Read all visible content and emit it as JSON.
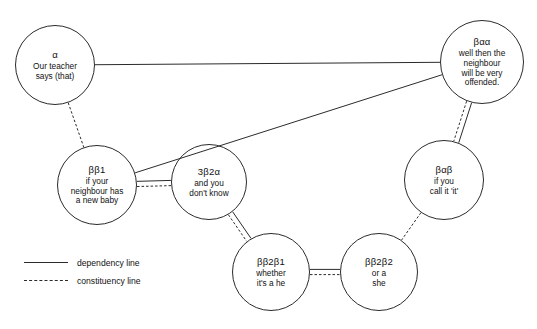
{
  "diagram": {
    "width": 537,
    "height": 329,
    "stroke_color": "#2b2b2b",
    "background_color": "#ffffff",
    "nodes": [
      {
        "id": "alpha",
        "label": "α",
        "lines": [
          "Our teacher",
          "says (that)"
        ],
        "cx": 55,
        "cy": 65,
        "r": 40
      },
      {
        "id": "beta-alpha-alpha",
        "label": "βαα",
        "lines": [
          "well then the",
          "neighbour",
          "will be very",
          "offended."
        ],
        "cx": 482,
        "cy": 62,
        "r": 42
      },
      {
        "id": "beta-beta-1",
        "label": "ββ1",
        "lines": [
          "if your",
          "neighbour has",
          "a new baby"
        ],
        "cx": 97,
        "cy": 185,
        "r": 40
      },
      {
        "id": "three-beta-2-alpha",
        "label": "3β2α",
        "lines": [
          "and you",
          "don't know"
        ],
        "cx": 209,
        "cy": 182,
        "r": 38
      },
      {
        "id": "beta-alpha-beta",
        "label": "βαβ",
        "lines": [
          "if you",
          "call it 'it'"
        ],
        "cx": 444,
        "cy": 180,
        "r": 40
      },
      {
        "id": "beta-beta-2-beta-1",
        "label": "ββ2β1",
        "lines": [
          "whether",
          "it's a he"
        ],
        "cx": 271,
        "cy": 272,
        "r": 39
      },
      {
        "id": "beta-beta-2-beta-2",
        "label": "ββ2β2",
        "lines": [
          "or a",
          "she"
        ],
        "cx": 379,
        "cy": 272,
        "r": 39
      }
    ],
    "edges": [
      {
        "id": "alpha-to-beta-alpha-alpha",
        "from": "alpha",
        "to": "beta-alpha-alpha",
        "kind": "dependency"
      },
      {
        "id": "beta-alpha-alpha-to-beta-beta-1",
        "from": "beta-alpha-alpha",
        "to": "beta-beta-1",
        "kind": "dependency"
      },
      {
        "id": "alpha-to-beta-beta-1",
        "from": "alpha",
        "to": "beta-beta-1",
        "kind": "constituency"
      },
      {
        "id": "beta-beta-1-to-three-beta-2-alpha",
        "from": "beta-beta-1",
        "to": "three-beta-2-alpha",
        "kind": "both"
      },
      {
        "id": "three-beta-2-alpha-to-beta-beta-2-beta-1",
        "from": "three-beta-2-alpha",
        "to": "beta-beta-2-beta-1",
        "kind": "both"
      },
      {
        "id": "beta-beta-2-beta-1-to-beta-beta-2-beta-2",
        "from": "beta-beta-2-beta-1",
        "to": "beta-beta-2-beta-2",
        "kind": "both"
      },
      {
        "id": "beta-alpha-alpha-to-beta-alpha-beta",
        "from": "beta-alpha-alpha",
        "to": "beta-alpha-beta",
        "kind": "both"
      },
      {
        "id": "beta-alpha-beta-to-beta-beta-2-beta-2",
        "from": "beta-alpha-beta",
        "to": "beta-beta-2-beta-2",
        "kind": "constituency"
      }
    ]
  },
  "legend": {
    "items": [
      {
        "id": "dependency",
        "style": "solid",
        "label": "dependency line"
      },
      {
        "id": "constituency",
        "style": "dashed",
        "label": "constituency line"
      }
    ]
  }
}
